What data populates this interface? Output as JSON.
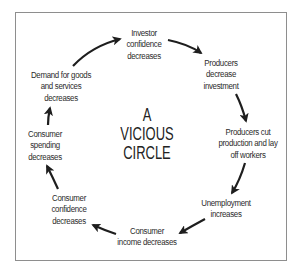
{
  "diagram": {
    "title_lines": [
      "A",
      "VICIOUS",
      "CIRCLE"
    ],
    "nodes": [
      {
        "id": "investor-confidence",
        "lines": [
          "Investor",
          "confidence",
          "decreases"
        ]
      },
      {
        "id": "producers-decrease-investment",
        "lines": [
          "Producers",
          "decrease",
          "investment"
        ]
      },
      {
        "id": "producers-cut-production",
        "lines": [
          "Producers cut",
          "production and lay",
          "off workers"
        ]
      },
      {
        "id": "unemployment-increases",
        "lines": [
          "Unemployment",
          "increases"
        ]
      },
      {
        "id": "consumer-income-decreases",
        "lines": [
          "Consumer",
          "income decreases"
        ]
      },
      {
        "id": "consumer-confidence-decreases",
        "lines": [
          "Consumer",
          "confidence",
          "decreases"
        ]
      },
      {
        "id": "consumer-spending-decreases",
        "lines": [
          "Consumer",
          "spending",
          "decreases"
        ]
      },
      {
        "id": "demand-decreases",
        "lines": [
          "Demand for goods",
          "and services",
          "decreases"
        ]
      }
    ],
    "edges": [
      {
        "from": "demand-decreases",
        "to": "investor-confidence"
      },
      {
        "from": "investor-confidence",
        "to": "producers-decrease-investment"
      },
      {
        "from": "producers-decrease-investment",
        "to": "producers-cut-production"
      },
      {
        "from": "producers-cut-production",
        "to": "unemployment-increases"
      },
      {
        "from": "unemployment-increases",
        "to": "consumer-income-decreases"
      },
      {
        "from": "consumer-income-decreases",
        "to": "consumer-confidence-decreases"
      },
      {
        "from": "consumer-confidence-decreases",
        "to": "consumer-spending-decreases"
      },
      {
        "from": "consumer-spending-decreases",
        "to": "demand-decreases"
      }
    ],
    "colors": {
      "text": "#2b2b2b",
      "arrow": "#1e1e1e",
      "frame": "#8e8e8e",
      "background": "#ffffff"
    }
  }
}
